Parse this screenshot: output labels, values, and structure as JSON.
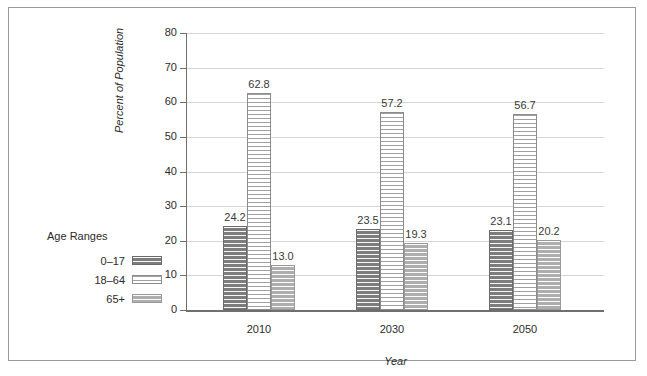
{
  "chart_data": {
    "type": "bar",
    "title": "",
    "subtitle": "",
    "xlabel": "Year",
    "ylabel": "Percent of Population",
    "categories": [
      "2010",
      "2030",
      "2050"
    ],
    "series": [
      {
        "name": "0–17",
        "values": [
          24.2,
          23.5,
          23.1
        ],
        "swatch": "dark",
        "color": "#7d7d7d"
      },
      {
        "name": "18–64",
        "values": [
          62.8,
          57.2,
          56.7
        ],
        "swatch": "white",
        "color": "#ffffff"
      },
      {
        "name": "65+",
        "values": [
          13.0,
          19.3,
          20.2
        ],
        "swatch": "mid",
        "color": "#aeaeae"
      }
    ],
    "ylim": [
      0,
      80
    ],
    "yticks": [
      0,
      10,
      20,
      30,
      40,
      50,
      60,
      70,
      80
    ],
    "ytick_labels": [
      "0",
      "10",
      "20",
      "30",
      "40",
      "50",
      "60",
      "70",
      "80"
    ],
    "value_labels": [
      [
        "24.2",
        "62.8",
        "13.0"
      ],
      [
        "23.5",
        "57.2",
        "19.3"
      ],
      [
        "23.1",
        "56.7",
        "20.2"
      ]
    ],
    "grid": true,
    "legend_position": "left-outside",
    "legend_title": "Age Ranges",
    "legend_entries": [
      "0–17",
      "18–64",
      "65+"
    ],
    "axis_color": "#6f6f6f",
    "grid_color": "#d5d5d5",
    "frame_color": "#9a9a9a"
  },
  "legend": {
    "title": "Age Ranges",
    "items": [
      {
        "label": "0–17"
      },
      {
        "label": "18–64"
      },
      {
        "label": "65+"
      }
    ]
  },
  "axes": {
    "y_title": "Percent of Population",
    "x_title": "Year",
    "y_labels": [
      "80",
      "70",
      "60",
      "50",
      "40",
      "30",
      "20",
      "10",
      "0"
    ],
    "x_labels": [
      "2010",
      "2030",
      "2050"
    ]
  }
}
